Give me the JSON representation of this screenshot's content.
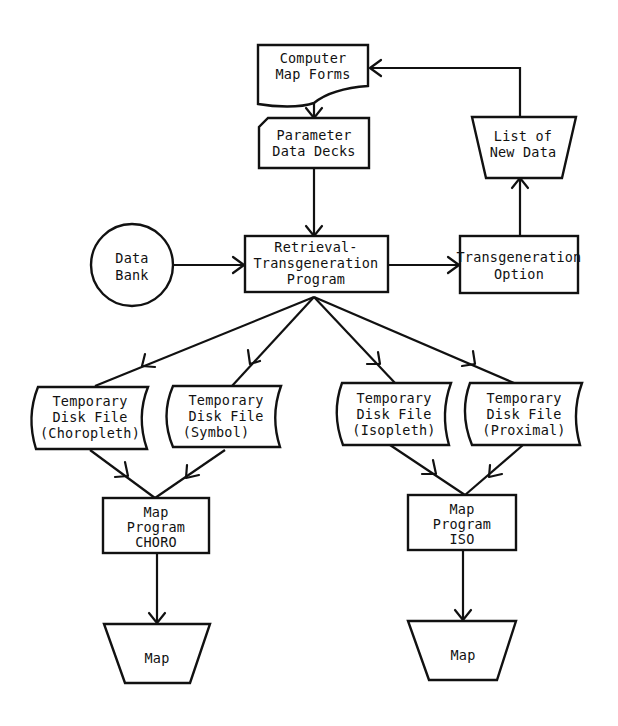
{
  "diagram": {
    "type": "flowchart",
    "colors": {
      "stroke": "#111111",
      "background": "#ffffff"
    },
    "nodes": {
      "computer_map_forms": {
        "shape": "document",
        "lines": [
          "Computer",
          "Map  Forms"
        ]
      },
      "parameter_data_decks": {
        "shape": "punched-card",
        "lines": [
          "Parameter",
          "Data  Decks"
        ]
      },
      "list_of_new_data": {
        "shape": "manual-operation-trapezoid",
        "lines": [
          "List of",
          "New  Data"
        ]
      },
      "data_bank": {
        "shape": "circle",
        "lines": [
          "Data",
          "Bank"
        ]
      },
      "retrieval_program": {
        "shape": "process",
        "lines": [
          "Retrieval-",
          "Transgeneration",
          "Program"
        ]
      },
      "transgeneration_option": {
        "shape": "process",
        "lines": [
          "Transgeneration",
          "Option"
        ]
      },
      "temp_choropleth": {
        "shape": "stored-data",
        "lines": [
          "Temporary",
          "Disk File",
          "(Choropleth)"
        ]
      },
      "temp_symbol": {
        "shape": "stored-data",
        "lines": [
          "Temporary",
          "Disk File",
          "(Symbol)"
        ]
      },
      "temp_isopleth": {
        "shape": "stored-data",
        "lines": [
          "Temporary",
          "Disk File",
          "(Isopleth)"
        ]
      },
      "temp_proximal": {
        "shape": "stored-data",
        "lines": [
          "Temporary",
          "Disk File",
          "(Proximal)"
        ]
      },
      "map_program_choro": {
        "shape": "process",
        "lines": [
          "Map",
          "Program",
          "CHORO"
        ]
      },
      "map_program_iso": {
        "shape": "process",
        "lines": [
          "Map",
          "Program",
          "ISO"
        ]
      },
      "map_choro_output": {
        "shape": "manual-operation-trapezoid",
        "lines": [
          "Map"
        ]
      },
      "map_iso_output": {
        "shape": "manual-operation-trapezoid",
        "lines": [
          "Map"
        ]
      }
    },
    "edges": [
      {
        "from": "computer_map_forms",
        "to": "parameter_data_decks"
      },
      {
        "from": "parameter_data_decks",
        "to": "retrieval_program"
      },
      {
        "from": "data_bank",
        "to": "retrieval_program"
      },
      {
        "from": "retrieval_program",
        "to": "transgeneration_option"
      },
      {
        "from": "transgeneration_option",
        "to": "list_of_new_data"
      },
      {
        "from": "list_of_new_data",
        "to": "computer_map_forms"
      },
      {
        "from": "retrieval_program",
        "to": "temp_choropleth"
      },
      {
        "from": "retrieval_program",
        "to": "temp_symbol"
      },
      {
        "from": "retrieval_program",
        "to": "temp_isopleth"
      },
      {
        "from": "retrieval_program",
        "to": "temp_proximal"
      },
      {
        "from": "temp_choropleth",
        "to": "map_program_choro"
      },
      {
        "from": "temp_symbol",
        "to": "map_program_choro"
      },
      {
        "from": "temp_isopleth",
        "to": "map_program_iso"
      },
      {
        "from": "temp_proximal",
        "to": "map_program_iso"
      },
      {
        "from": "map_program_choro",
        "to": "map_choro_output"
      },
      {
        "from": "map_program_iso",
        "to": "map_iso_output"
      }
    ]
  }
}
